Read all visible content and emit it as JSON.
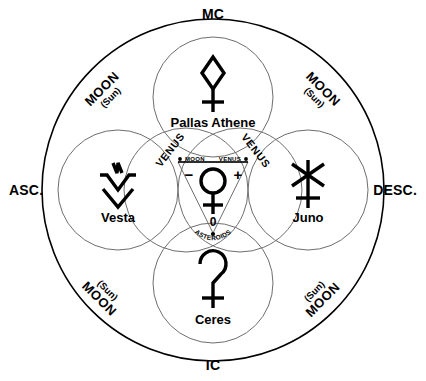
{
  "diagram": {
    "colors": {
      "stroke": "#000000",
      "thin_stroke": "#555555",
      "background": "#ffffff"
    },
    "axes": {
      "top": "MC",
      "bottom": "IC",
      "left": "ASC.",
      "right": "DESC."
    },
    "quadrants": [
      {
        "position": "top-left",
        "primary": "MOON",
        "secondary": "(Sun)",
        "order": "primary-first"
      },
      {
        "position": "top-right",
        "primary": "MOON",
        "secondary": "(Sun)",
        "order": "primary-first"
      },
      {
        "position": "bottom-left",
        "primary": "MOON",
        "secondary": "(Sun)",
        "order": "secondary-first"
      },
      {
        "position": "bottom-right",
        "primary": "MOON",
        "secondary": "(Sun)",
        "order": "secondary-first"
      }
    ],
    "planets": [
      {
        "id": "pallas",
        "name": "Pallas Athene",
        "glyph": "pallas-athene-glyph",
        "position": "top"
      },
      {
        "id": "vesta",
        "name": "Vesta",
        "glyph": "vesta-glyph",
        "position": "left"
      },
      {
        "id": "juno",
        "name": "Juno",
        "glyph": "juno-glyph",
        "position": "right"
      },
      {
        "id": "ceres",
        "name": "Ceres",
        "glyph": "ceres-glyph",
        "position": "bottom"
      }
    ],
    "inner_arc_labels": [
      {
        "id": "venus-left",
        "text": "VENUS"
      },
      {
        "id": "venus-right",
        "text": "VENUS"
      }
    ],
    "core": {
      "glyph": "venus-glyph",
      "left_node_label": "MOON",
      "right_node_label": "VENUS",
      "left_sign": "−",
      "right_sign": "+",
      "zero_label": "0",
      "bottom_label": "ASTEROIDS"
    }
  }
}
